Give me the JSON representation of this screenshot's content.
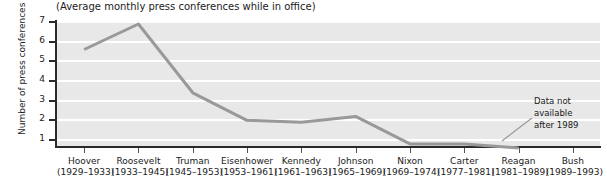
{
  "chart_data": {
    "type": "line",
    "title": "(Average monthly press conferences while in office)",
    "xlabel": "",
    "ylabel": "Number of press conferences",
    "ylim": [
      0,
      7
    ],
    "yticks": [
      1,
      2,
      3,
      4,
      5,
      6,
      7
    ],
    "ytick_labels": [
      "1",
      "2",
      "3",
      "4",
      "5",
      "6",
      "7"
    ],
    "grid": true,
    "legend": "none",
    "line_color": "#999999",
    "plot_background": "#e8e8e8",
    "categories": [
      "Hoover",
      "Roosevelt",
      "Truman",
      "Eisenhower",
      "Kennedy",
      "Johnson",
      "Nixon",
      "Carter",
      "Reagan",
      "Bush"
    ],
    "category_years": [
      "(1929–1933)",
      "(1933–1945)",
      "(1945–1953)",
      "(1953–1961)",
      "(1961–1963)",
      "(1965–1969)",
      "(1969–1974)",
      "(1977–1981)",
      "(1981–1989)",
      "(1989–1993)"
    ],
    "values": [
      5.6,
      6.9,
      3.4,
      2.0,
      1.9,
      2.2,
      0.8,
      0.8,
      0.6,
      null
    ],
    "annotations": [
      {
        "name": "data-not-available-note",
        "line1": "Data not",
        "line2": "available",
        "line3": "after 1989"
      }
    ]
  }
}
